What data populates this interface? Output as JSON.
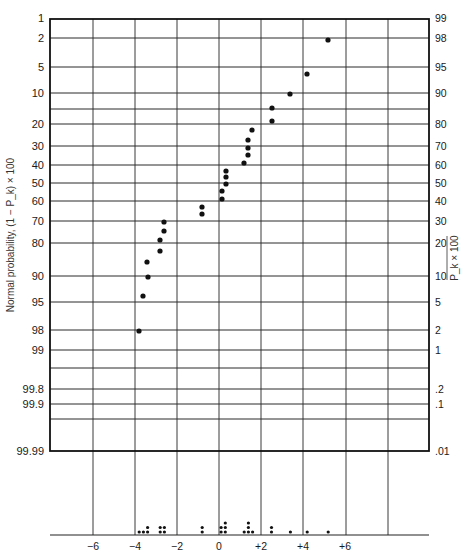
{
  "chart_data": {
    "type": "scatter",
    "title": "",
    "subtitle": "Normal probability plot with dot diagram of effects",
    "ylabel_left": "Normal probability, (1 − P_k) × 100",
    "ylabel_right": "P_k × 100",
    "xlabel": "",
    "x_ticks": [
      -6,
      -4,
      -2,
      0,
      2,
      4,
      6
    ],
    "x_tick_labels": [
      "−6",
      "−4",
      "−2",
      "0",
      "+2",
      "+4",
      "+6"
    ],
    "xlim": [
      -8,
      10
    ],
    "left_ticks": [
      "1",
      "2",
      "5",
      "10",
      "20",
      "30",
      "40",
      "50",
      "60",
      "70",
      "80",
      "90",
      "95",
      "98",
      "99",
      "99.8",
      "99.9",
      "99.99"
    ],
    "right_ticks": [
      "99",
      "98",
      "95",
      "90",
      "80",
      "70",
      "60",
      "50",
      "40",
      "30",
      "20",
      "10",
      "5",
      "2",
      "1",
      ".2",
      ".1",
      ".01"
    ],
    "grid": true,
    "legend": "none",
    "probability_points": [
      {
        "x": 5.2,
        "p": 2
      },
      {
        "x": 4.2,
        "p": 6
      },
      {
        "x": 3.4,
        "p": 10
      },
      {
        "x": 2.5,
        "p": 14
      },
      {
        "x": 2.5,
        "p": 18
      },
      {
        "x": 1.6,
        "p": 22
      },
      {
        "x": 1.4,
        "p": 26
      },
      {
        "x": 1.4,
        "p": 30
      },
      {
        "x": 1.4,
        "p": 34
      },
      {
        "x": 1.2,
        "p": 38
      },
      {
        "x": 0.3,
        "p": 42
      },
      {
        "x": 0.3,
        "p": 46
      },
      {
        "x": 0.3,
        "p": 50
      },
      {
        "x": 0.1,
        "p": 54
      },
      {
        "x": 0.1,
        "p": 58
      },
      {
        "x": -0.8,
        "p": 62
      },
      {
        "x": -0.8,
        "p": 66
      },
      {
        "x": -2.6,
        "p": 70
      },
      {
        "x": -2.6,
        "p": 74
      },
      {
        "x": -2.8,
        "p": 78
      },
      {
        "x": -2.8,
        "p": 82
      },
      {
        "x": -3.4,
        "p": 86
      },
      {
        "x": -3.4,
        "p": 90
      },
      {
        "x": -3.6,
        "p": 94
      },
      {
        "x": -3.8,
        "p": 98
      }
    ],
    "dot_diagram": [
      {
        "x": -3.8,
        "count": 1
      },
      {
        "x": -3.6,
        "count": 1
      },
      {
        "x": -3.4,
        "count": 2
      },
      {
        "x": -2.8,
        "count": 2
      },
      {
        "x": -2.6,
        "count": 2
      },
      {
        "x": -0.8,
        "count": 2
      },
      {
        "x": 0.1,
        "count": 2
      },
      {
        "x": 0.3,
        "count": 3
      },
      {
        "x": 1.2,
        "count": 1
      },
      {
        "x": 1.4,
        "count": 3
      },
      {
        "x": 1.6,
        "count": 1
      },
      {
        "x": 2.5,
        "count": 2
      },
      {
        "x": 3.4,
        "count": 1
      },
      {
        "x": 4.2,
        "count": 1
      },
      {
        "x": 5.2,
        "count": 1
      }
    ]
  },
  "layout": {
    "frame": {
      "left": 50,
      "right": 429,
      "top": 19,
      "bottom": 451
    },
    "baseline_y": 535,
    "x_zero_px": 219,
    "px_per_unit": 21,
    "vlines_x": [
      93,
      135,
      177,
      219,
      261,
      303,
      346,
      388
    ],
    "hlines": [
      {
        "y": 38,
        "left": "2",
        "right": "98"
      },
      {
        "y": 67,
        "left": "5",
        "right": "95"
      },
      {
        "y": 93,
        "left": "10",
        "right": "90"
      },
      {
        "y": 109,
        "left": "",
        "right": ""
      },
      {
        "y": 124,
        "left": "20",
        "right": "80"
      },
      {
        "y": 146,
        "left": "30",
        "right": "70"
      },
      {
        "y": 165,
        "left": "40",
        "right": "60"
      },
      {
        "y": 183,
        "left": "50",
        "right": "50"
      },
      {
        "y": 201,
        "left": "60",
        "right": "40"
      },
      {
        "y": 221,
        "left": "70",
        "right": "30"
      },
      {
        "y": 243,
        "left": "80",
        "right": "20"
      },
      {
        "y": 276,
        "left": "90",
        "right": "10"
      },
      {
        "y": 302,
        "left": "95",
        "right": "5"
      },
      {
        "y": 330,
        "left": "98",
        "right": "2"
      },
      {
        "y": 350,
        "left": "99",
        "right": "1"
      },
      {
        "y": 368,
        "left": "",
        "right": ""
      },
      {
        "y": 389,
        "left": "99.8",
        "right": ".2"
      },
      {
        "y": 404,
        "left": "99.9",
        "right": ".1"
      },
      {
        "y": 419,
        "left": "",
        "right": ""
      }
    ],
    "top_labels": {
      "left": "1",
      "right": "99"
    },
    "bottom_labels": {
      "left": "99.99",
      "right": ".01"
    },
    "points_px": [
      [
        328,
        40
      ],
      [
        307,
        74
      ],
      [
        290,
        94
      ],
      [
        272,
        108
      ],
      [
        272,
        121
      ],
      [
        252,
        130
      ],
      [
        248,
        140
      ],
      [
        248,
        148
      ],
      [
        248,
        155
      ],
      [
        244,
        163
      ],
      [
        226,
        171
      ],
      [
        226,
        177
      ],
      [
        226,
        184
      ],
      [
        222,
        191
      ],
      [
        222,
        199
      ],
      [
        202,
        207
      ],
      [
        202,
        214
      ],
      [
        164,
        222
      ],
      [
        164,
        231
      ],
      [
        160,
        240
      ],
      [
        160,
        251
      ],
      [
        147,
        262
      ],
      [
        148,
        277
      ],
      [
        143,
        296
      ],
      [
        139,
        331
      ]
    ],
    "dot_color": "#111111",
    "grid_color": "#2a2a2a"
  }
}
